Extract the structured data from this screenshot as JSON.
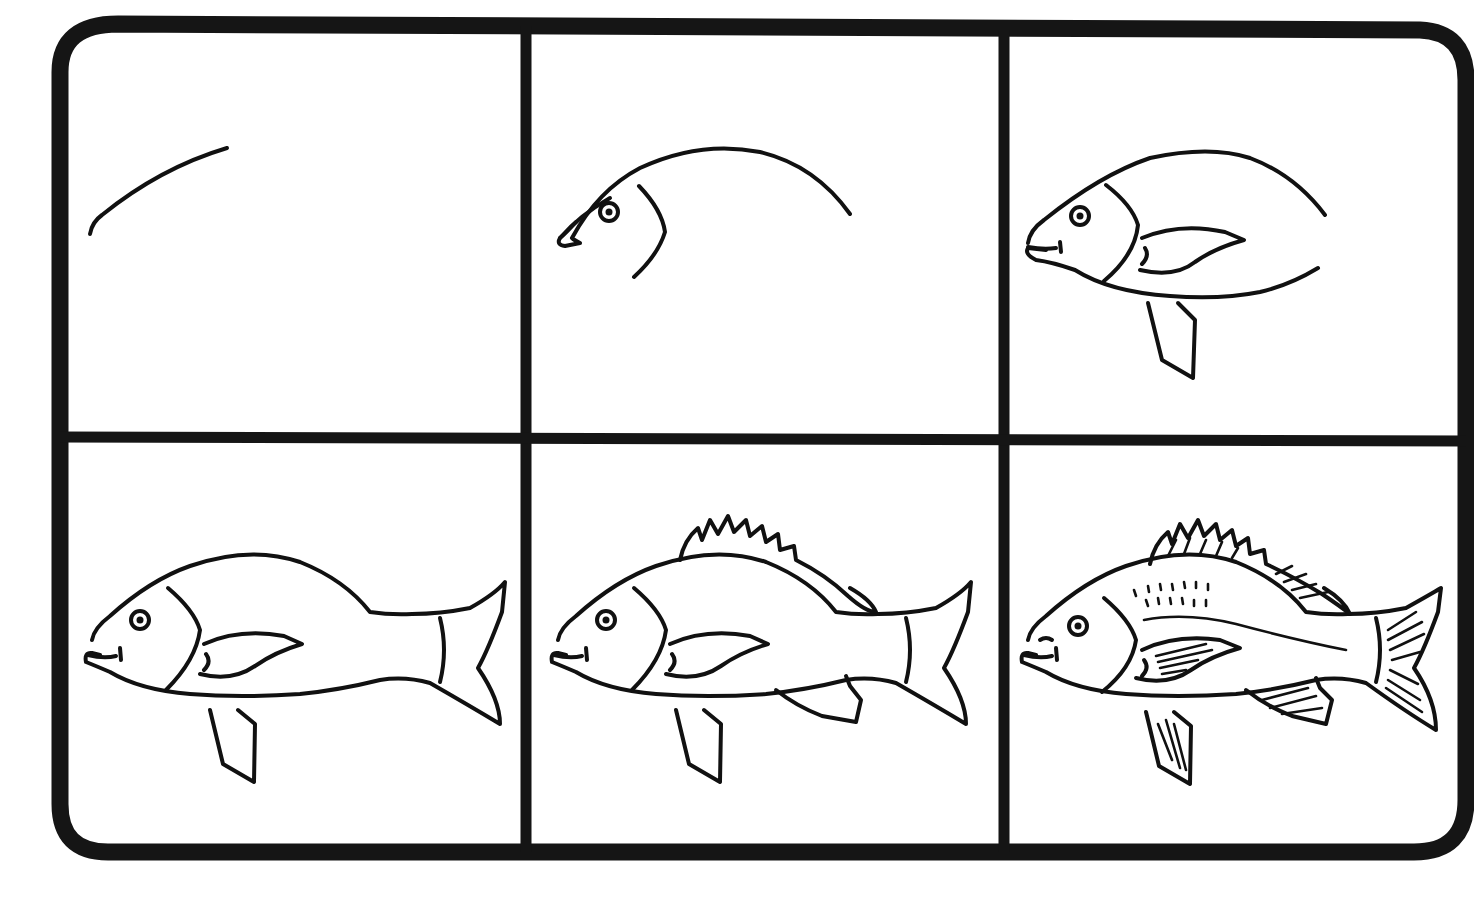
{
  "layout": {
    "rows": 2,
    "columns": 3,
    "background": "#ffffff",
    "ink": "#111111"
  },
  "steps": [
    {
      "index": 1,
      "label": "Step 1",
      "description": "Draw a curved line for the back of the head"
    },
    {
      "index": 2,
      "label": "Step 2",
      "description": "Extend the back curve and add the snout, eye and gill line"
    },
    {
      "index": 3,
      "label": "Step 3",
      "description": "Close the belly, add the mouth, pectoral fin and pelvic fin"
    },
    {
      "index": 4,
      "label": "Step 4",
      "description": "Add the tail and tail divider line"
    },
    {
      "index": 5,
      "label": "Step 5",
      "description": "Add the spiky dorsal fin and the anal fin"
    },
    {
      "index": 6,
      "label": "Step 6",
      "description": "Add details: scales, lateral line and fin rays"
    }
  ]
}
